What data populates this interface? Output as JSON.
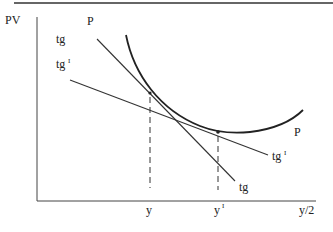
{
  "diagram": {
    "y_axis_label": "PV",
    "x_axis_label": "y/2",
    "curve_label_top": "P",
    "curve_label_right": "P",
    "tangent_label_top": "tg",
    "tangent_label_bottom": "tg",
    "tangent_prime_label_top": "tg",
    "tangent_prime_label_bottom": "tg",
    "prime_mark": "I",
    "tick_y": "y",
    "tick_y_prime": "y",
    "colors": {
      "line": "#222222",
      "background": "#ffffff"
    }
  }
}
